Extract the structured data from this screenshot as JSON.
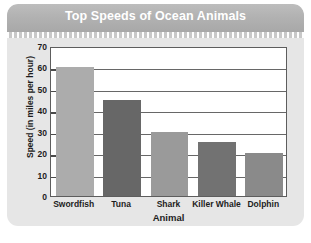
{
  "card": {
    "background_color": "#e6e6e6",
    "header_color": "#b2b2b2"
  },
  "chart_data": {
    "type": "bar",
    "title": "Top Speeds of Ocean Animals",
    "xlabel": "Animal",
    "ylabel": "Speed (in miles per hour)",
    "categories": [
      "Swordfish",
      "Tuna",
      "Shark",
      "Killer Whale",
      "Dolphin"
    ],
    "values": [
      60,
      45,
      30,
      25,
      20
    ],
    "bar_colors": [
      "#acacac",
      "#676767",
      "#9a9a9a",
      "#727272",
      "#8a8a8a"
    ],
    "ylim": [
      0,
      70
    ],
    "ytick_labels": [
      "0",
      "10",
      "20",
      "30",
      "40",
      "50",
      "60",
      "70"
    ],
    "ytick_values": [
      0,
      10,
      20,
      30,
      40,
      50,
      60,
      70
    ],
    "grid": true,
    "grid_color": "#676767",
    "legend": null,
    "plot_background": "#ffffff",
    "axis_color": "#5d5d5d"
  }
}
